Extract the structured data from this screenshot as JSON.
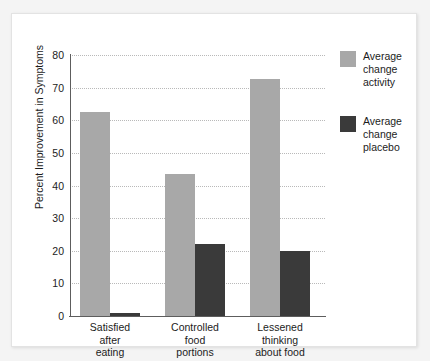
{
  "chart_data": {
    "type": "bar",
    "title": "",
    "xlabel": "",
    "ylabel": "Percent Improvement in Symptoms",
    "ylim": [
      0,
      80
    ],
    "yticks": [
      0,
      10,
      20,
      30,
      40,
      50,
      60,
      70,
      80
    ],
    "ytick_labels": [
      "0",
      "10",
      "20",
      "30",
      "40",
      "50",
      "60",
      "70",
      "80"
    ],
    "grid": true,
    "grid_axis": "y",
    "grid_style": "dotted",
    "legend_position": "right",
    "categories": [
      "Satisfied\nafter\neating",
      "Controlled\nfood\nportions",
      "Lessened\nthinking\nabout food"
    ],
    "series": [
      {
        "name": "Average\nchange\nactivity",
        "color": "#a8a8a8",
        "values": [
          62.5,
          43.5,
          72.5
        ]
      },
      {
        "name": "Average\nchange\nplacebo",
        "color": "#3a3a3a",
        "values": [
          1,
          22,
          20
        ]
      }
    ]
  },
  "legend": {
    "entries": [
      {
        "label": "Average\nchange\nactivity",
        "color": "#a8a8a8"
      },
      {
        "label": "Average\nchange\nplacebo",
        "color": "#3a3a3a"
      }
    ]
  },
  "axes": {
    "y_title": "Percent Improvement in Symptoms",
    "y_tick_labels": [
      "80",
      "70",
      "60",
      "50",
      "40",
      "30",
      "20",
      "10",
      "0"
    ],
    "x_tick_labels": [
      "Satisfied\nafter\neating",
      "Controlled\nfood\nportions",
      "Lessened\nthinking\nabout food"
    ]
  },
  "colors": {
    "activity": "#a8a8a8",
    "placebo": "#3a3a3a",
    "axis": "#5d5d5d",
    "grid": "#b9b9b9",
    "card_background": "#ffffff",
    "page_background": "#f4f4f4"
  }
}
